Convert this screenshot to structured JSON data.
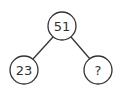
{
  "diagram": {
    "type": "number-bond",
    "nodes": [
      {
        "id": "whole",
        "label": "51"
      },
      {
        "id": "part-left",
        "label": "23"
      },
      {
        "id": "part-right",
        "label": "?"
      }
    ],
    "line_color": "#333333"
  }
}
